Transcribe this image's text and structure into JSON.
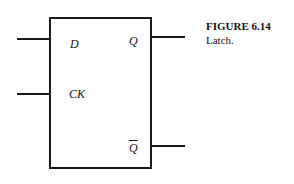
{
  "figure": {
    "title": "FIGURE 6.14",
    "caption": "Latch."
  },
  "latch": {
    "inputs": [
      {
        "label": "D"
      },
      {
        "label": "CK"
      }
    ],
    "outputs": [
      {
        "label": "Q"
      },
      {
        "label": "Q"
      }
    ],
    "output_complement_index": 1
  }
}
